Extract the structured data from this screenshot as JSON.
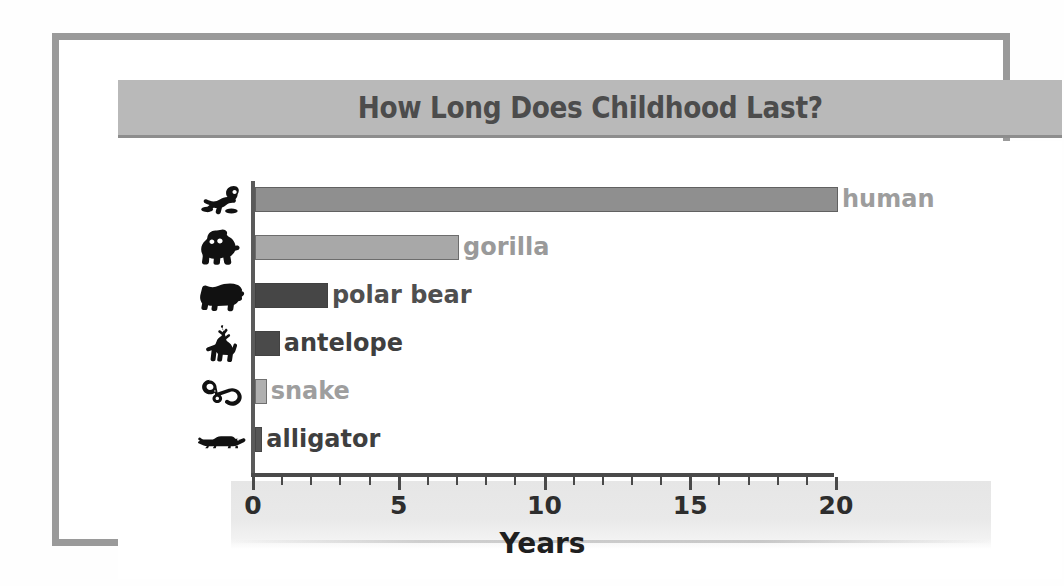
{
  "chart_data": {
    "type": "bar",
    "orientation": "horizontal",
    "title": "How Long Does Childhood Last?",
    "xlabel": "Years",
    "ylabel": "",
    "xlim": [
      0,
      20
    ],
    "grid": false,
    "legend": "none",
    "tick_labels": [
      "0",
      "5",
      "10",
      "15",
      "20"
    ],
    "tick_values": [
      0,
      5,
      10,
      15,
      20
    ],
    "minor_tick_interval": 1,
    "categories": [
      "human",
      "gorilla",
      "polar bear",
      "antelope",
      "snake",
      "alligator"
    ],
    "values": [
      20,
      7,
      2.5,
      0.85,
      0.4,
      0.25
    ],
    "bars": [
      {
        "label": "human",
        "value": 20,
        "icon": "baby-icon",
        "bar_color": "#8f8f8f",
        "label_color": "#9d9d9d",
        "label_inside": false
      },
      {
        "label": "gorilla",
        "value": 7,
        "icon": "gorilla-icon",
        "bar_color": "#a8a8a8",
        "label_color": "#9a9a9a",
        "label_inside": false
      },
      {
        "label": "polar bear",
        "value": 2.5,
        "icon": "polar-bear-icon",
        "bar_color": "#464646",
        "label_color": "#4f4f4f",
        "label_inside": false
      },
      {
        "label": "antelope",
        "value": 0.85,
        "icon": "antelope-icon",
        "bar_color": "#4a4a4a",
        "label_color": "#3f3f3f",
        "label_inside": false
      },
      {
        "label": "snake",
        "value": 0.4,
        "icon": "snake-icon",
        "bar_color": "#b0b0b0",
        "label_color": "#9e9e9e",
        "label_inside": false
      },
      {
        "label": "alligator",
        "value": 0.25,
        "icon": "alligator-icon",
        "bar_color": "#565656",
        "label_color": "#3f3f3f",
        "label_inside": false
      }
    ]
  },
  "colors": {
    "frame": "#9a9a9a",
    "title_band": "#b9b9b9",
    "title_text": "#4c4c4c",
    "axis": "#4a4a4a",
    "plot_background": "#ffffff",
    "axis_band": "#e9e9e9"
  }
}
